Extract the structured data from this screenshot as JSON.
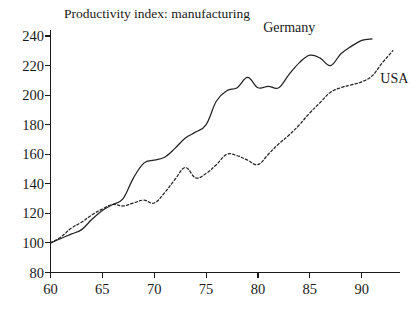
{
  "chart_data": {
    "type": "line",
    "title": "Productivity index: manufacturing",
    "xlabel": "",
    "ylabel": "",
    "xlim": [
      60,
      93.5
    ],
    "ylim": [
      80,
      244
    ],
    "grid": false,
    "legend_position": "inline-labels",
    "y_ticks": [
      80,
      100,
      120,
      140,
      160,
      180,
      200,
      220,
      240
    ],
    "y_tick_labels": [
      "80",
      "100",
      "120",
      "140",
      "160",
      "180",
      "200",
      "220",
      "240"
    ],
    "x_ticks": [
      60,
      65,
      70,
      75,
      80,
      85,
      90
    ],
    "x_tick_labels": [
      "60",
      "65",
      "70",
      "75",
      "80",
      "85",
      "90"
    ],
    "series": [
      {
        "name": "Germany",
        "style": "solid",
        "color": "#222222",
        "label_x": 80.5,
        "label_y": 243,
        "x": [
          60,
          61,
          62,
          63,
          64,
          65,
          66,
          67,
          68,
          69,
          70,
          71,
          72,
          73,
          74,
          75,
          76,
          77,
          78,
          79,
          80,
          81,
          82,
          83,
          84,
          85,
          86,
          87,
          88,
          89,
          90,
          91
        ],
        "values": [
          100,
          103,
          106,
          109,
          116,
          122,
          126,
          130,
          144,
          154,
          156,
          158,
          164,
          171,
          175,
          180,
          196,
          203,
          205,
          212,
          205,
          206,
          205,
          214,
          222,
          227,
          225,
          220,
          228,
          233,
          237,
          238
        ]
      },
      {
        "name": "USA",
        "style": "dashed",
        "color": "#222222",
        "label_x": 91.8,
        "label_y": 208,
        "x": [
          60,
          61,
          62,
          63,
          64,
          65,
          66,
          67,
          68,
          69,
          70,
          71,
          72,
          73,
          74,
          75,
          76,
          77,
          78,
          79,
          80,
          81,
          82,
          83,
          84,
          85,
          86,
          87,
          88,
          89,
          90,
          91,
          92,
          93
        ],
        "values": [
          100,
          104,
          110,
          114,
          119,
          123,
          126,
          125,
          127,
          129,
          127,
          134,
          143,
          151,
          144,
          147,
          153,
          160,
          159,
          156,
          153,
          160,
          167,
          173,
          180,
          188,
          195,
          202,
          205,
          207,
          209,
          213,
          222,
          230
        ]
      }
    ],
    "annotations": [
      {
        "text": "Germany",
        "x": 80.5,
        "y": 243
      },
      {
        "text": "USA",
        "x": 91.8,
        "y": 208
      }
    ]
  },
  "labels": {
    "title": "Productivity index: manufacturing",
    "germany": "Germany",
    "usa": "USA"
  }
}
